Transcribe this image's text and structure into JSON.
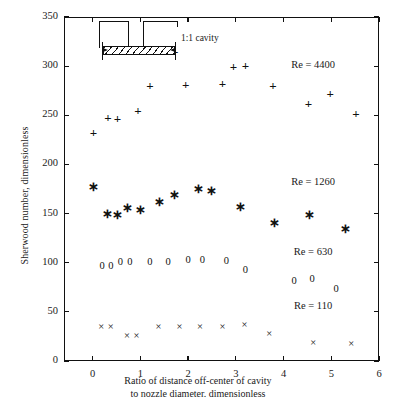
{
  "chart_data": {
    "type": "scatter",
    "title": "",
    "xlabel": "Ratio of distance off-center of cavity to nozzle diameter. dimensionless",
    "xlabel_line1": "Ratio of distance off-center of cavity",
    "xlabel_line2": "to nozzle diameter. dimensionless",
    "ylabel": "Sherwood number, dimensionless",
    "xlim": [
      -0.6,
      6.0
    ],
    "ylim": [
      0,
      350
    ],
    "xticks": [
      0,
      1,
      2,
      3,
      4,
      5,
      6
    ],
    "xticklabels": [
      "0",
      "1",
      "2",
      "3",
      "4",
      "5",
      "6"
    ],
    "yticks": [
      0,
      50,
      100,
      150,
      200,
      250,
      300,
      350
    ],
    "yticklabels": [
      "0",
      "50",
      "100",
      "150",
      "200",
      "250",
      "300",
      "350"
    ],
    "grid": false,
    "legend_position": "inline-right",
    "annotations": [
      {
        "text": "1:1 cavity",
        "x": 1.85,
        "y": 328
      }
    ],
    "series": [
      {
        "name": "Re = 4400",
        "marker": "+",
        "label_x": 4.62,
        "label_y": 302,
        "points": [
          {
            "x": 0.02,
            "y": 233
          },
          {
            "x": 0.32,
            "y": 248
          },
          {
            "x": 0.52,
            "y": 247
          },
          {
            "x": 0.95,
            "y": 255
          },
          {
            "x": 1.2,
            "y": 281
          },
          {
            "x": 1.72,
            "y": 315
          },
          {
            "x": 1.95,
            "y": 282
          },
          {
            "x": 2.72,
            "y": 283
          },
          {
            "x": 2.95,
            "y": 300
          },
          {
            "x": 3.2,
            "y": 301
          },
          {
            "x": 3.78,
            "y": 281
          },
          {
            "x": 4.52,
            "y": 263
          },
          {
            "x": 4.98,
            "y": 273
          },
          {
            "x": 5.52,
            "y": 252
          }
        ]
      },
      {
        "name": "Re = 1260",
        "marker": "*",
        "label_x": 4.62,
        "label_y": 183,
        "points": [
          {
            "x": 0.02,
            "y": 178
          },
          {
            "x": 0.32,
            "y": 151
          },
          {
            "x": 0.52,
            "y": 150
          },
          {
            "x": 0.72,
            "y": 157
          },
          {
            "x": 1.0,
            "y": 155
          },
          {
            "x": 1.4,
            "y": 163
          },
          {
            "x": 1.72,
            "y": 170
          },
          {
            "x": 2.22,
            "y": 176
          },
          {
            "x": 2.5,
            "y": 174
          },
          {
            "x": 3.1,
            "y": 158
          },
          {
            "x": 3.82,
            "y": 141
          },
          {
            "x": 4.55,
            "y": 150
          },
          {
            "x": 5.3,
            "y": 135
          }
        ]
      },
      {
        "name": "Re = 630",
        "marker": "0",
        "label_x": 4.62,
        "label_y": 112,
        "points": [
          {
            "x": 0.2,
            "y": 97
          },
          {
            "x": 0.38,
            "y": 97
          },
          {
            "x": 0.58,
            "y": 101
          },
          {
            "x": 0.78,
            "y": 101
          },
          {
            "x": 1.2,
            "y": 101
          },
          {
            "x": 1.58,
            "y": 101
          },
          {
            "x": 2.0,
            "y": 103
          },
          {
            "x": 2.3,
            "y": 103
          },
          {
            "x": 2.8,
            "y": 102
          },
          {
            "x": 3.2,
            "y": 93
          },
          {
            "x": 4.22,
            "y": 81
          },
          {
            "x": 4.6,
            "y": 83
          },
          {
            "x": 5.1,
            "y": 73
          }
        ]
      },
      {
        "name": "Re = 110",
        "marker": "x",
        "label_x": 4.62,
        "label_y": 57,
        "points": [
          {
            "x": 0.18,
            "y": 35
          },
          {
            "x": 0.38,
            "y": 35
          },
          {
            "x": 0.72,
            "y": 25
          },
          {
            "x": 0.92,
            "y": 25
          },
          {
            "x": 1.38,
            "y": 35
          },
          {
            "x": 1.82,
            "y": 35
          },
          {
            "x": 2.25,
            "y": 35
          },
          {
            "x": 2.72,
            "y": 35
          },
          {
            "x": 3.18,
            "y": 37
          },
          {
            "x": 3.7,
            "y": 27
          },
          {
            "x": 4.62,
            "y": 18
          },
          {
            "x": 5.42,
            "y": 17
          }
        ]
      }
    ]
  },
  "inset": {
    "name": "nozzle-cavity-schematic",
    "caption": "1:1 cavity",
    "description": "Nozzle plate with hatched 1:1 cavity and dimension arrows"
  }
}
